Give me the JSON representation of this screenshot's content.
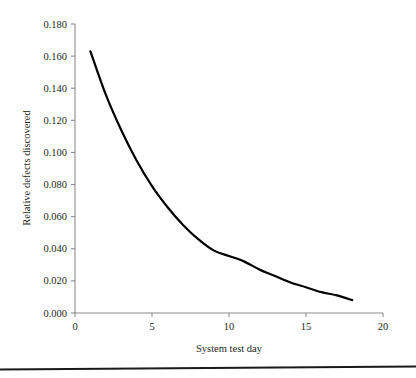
{
  "chart_data": {
    "type": "line",
    "title": "",
    "xlabel": "System test day",
    "ylabel": "Relative defects discovered",
    "xlim": [
      0,
      20
    ],
    "ylim": [
      0.0,
      0.18
    ],
    "grid": false,
    "legend": null,
    "xticks": [
      "0",
      "5",
      "10",
      "15",
      "20"
    ],
    "xtick_values": [
      0,
      5,
      10,
      15,
      20
    ],
    "yticks": [
      "0.000",
      "0.020",
      "0.040",
      "0.060",
      "0.080",
      "0.100",
      "0.120",
      "0.140",
      "0.160",
      "0.180"
    ],
    "ytick_values": [
      0.0,
      0.02,
      0.04,
      0.06,
      0.08,
      0.1,
      0.12,
      0.14,
      0.16,
      0.18
    ],
    "series": [
      {
        "name": "Relative defects discovered",
        "color": "#000000",
        "linewidth": 2.2,
        "x": [
          1,
          2,
          3,
          4,
          5,
          6,
          7,
          8,
          9,
          10,
          11,
          12,
          13,
          14,
          15,
          16,
          17,
          18
        ],
        "values": [
          0.163,
          0.136,
          0.114,
          0.095,
          0.079,
          0.066,
          0.055,
          0.046,
          0.039,
          0.04,
          0.032,
          0.027,
          0.023,
          0.019,
          0.016,
          0.013,
          0.011,
          0.008
        ]
      }
    ]
  },
  "axes": {
    "x_axis_title": "System test day",
    "y_axis_title": "Relative defects discovered"
  },
  "colors": {
    "curve": "#000000",
    "axis": "#8b8b8b",
    "text": "#231f20",
    "rule": "#1a1a1a",
    "background": "#ffffff"
  },
  "footer": {
    "rule_present": "true"
  }
}
